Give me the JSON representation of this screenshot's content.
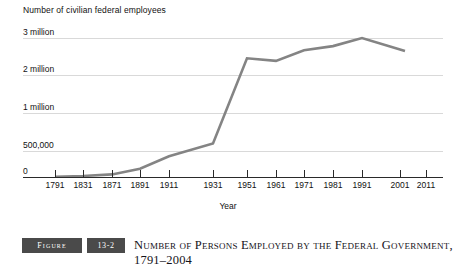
{
  "chart_data": {
    "type": "line",
    "title": "",
    "ylabel": "Number of civilian federal employees",
    "xlabel": "Year",
    "grid": true,
    "legend": "none",
    "y_tick_labels": [
      "3 million",
      "2 million",
      "1 million",
      "500,000",
      "0"
    ],
    "y_tick_values": [
      3000000,
      2000000,
      1000000,
      500000,
      0
    ],
    "x_tick_labels": [
      "1791",
      "1831",
      "1871",
      "1891",
      "1911",
      "1931",
      "1951",
      "1961",
      "1971",
      "1981",
      "1991",
      "2001",
      "2011"
    ],
    "x": [
      1791,
      1831,
      1871,
      1891,
      1911,
      1931,
      1951,
      1961,
      1971,
      1981,
      1991,
      2001
    ],
    "values": [
      5000,
      20000,
      50000,
      160000,
      400000,
      600000,
      2450000,
      2380000,
      2670000,
      2780000,
      3000000,
      2650000
    ],
    "series": [
      {
        "name": "Civilian federal employees",
        "color": "#848484",
        "values": [
          5000,
          20000,
          50000,
          160000,
          400000,
          600000,
          2450000,
          2380000,
          2670000,
          2780000,
          3000000,
          2650000
        ]
      }
    ],
    "ylim": [
      0,
      3200000
    ],
    "note": "y-axis is non-linear: 500,000 is plotted midway between 0 and 1 million"
  },
  "caption": {
    "figure_label": "Figure",
    "figure_number": "13-2",
    "title": "Number of Persons Employed by the Federal Government, 1791–2004"
  },
  "colors": {
    "line": "#848484",
    "gridline": "#d9d9d9",
    "axis": "#2a2a2a",
    "badge_bg": "#4a4a4a",
    "text": "#111111"
  }
}
